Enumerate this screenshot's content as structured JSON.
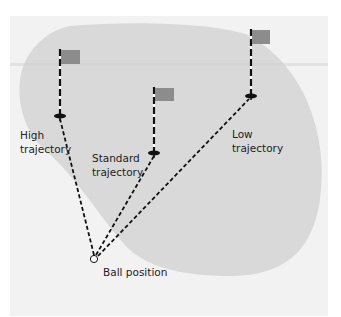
{
  "diagram": {
    "colors": {
      "page_background": "#ffffff",
      "panel_background": "#f2f2f2",
      "green": "#d9d9d9",
      "flag": "#8c8c8c",
      "line": "#111111",
      "ball_fill": "#ffffff"
    },
    "pins": [
      {
        "id": "high",
        "pole_x": 60,
        "flag_top": 50,
        "hole_y": 116
      },
      {
        "id": "standard",
        "pole_x": 154,
        "flag_top": 88,
        "hole_y": 153
      },
      {
        "id": "low",
        "pole_x": 251,
        "flag_top": 30,
        "hole_y": 96
      }
    ],
    "ball": {
      "x": 94,
      "y": 259
    },
    "labels": {
      "high_line1": "High",
      "high_line2": "trajectory",
      "standard_line1": "Standard",
      "standard_line2": "trajectory",
      "low_line1": "Low",
      "low_line2": "trajectory",
      "ball": "Ball position"
    }
  }
}
